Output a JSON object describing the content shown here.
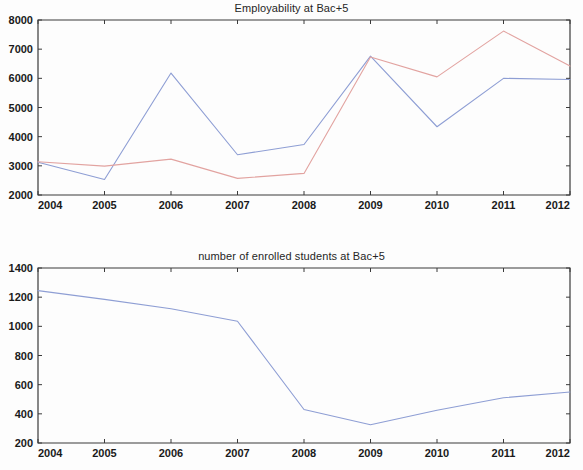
{
  "figure": {
    "background_color": "#fdfdfd",
    "axis_color": "#3a3a3a",
    "width": 583,
    "height": 470
  },
  "chart_data": [
    {
      "type": "line",
      "id": "employability",
      "title": "Employability at Bac+5",
      "xlabel": "",
      "ylabel": "",
      "x": [
        2004,
        2005,
        2006,
        2007,
        2008,
        2009,
        2010,
        2011,
        2012
      ],
      "categories": [
        "2004",
        "2005",
        "2006",
        "2007",
        "2008",
        "2009",
        "2010",
        "2011",
        "2012"
      ],
      "xlim": [
        2004,
        2012
      ],
      "ylim": [
        2000,
        8000
      ],
      "ytick_labels": [
        "8000",
        "7000",
        "6000",
        "5000",
        "4000",
        "3000",
        "2000"
      ],
      "yticks": [
        8000,
        7000,
        6000,
        5000,
        4000,
        3000,
        2000
      ],
      "xtick_labels": [
        "2004",
        "2005",
        "2006",
        "2007",
        "2008",
        "2009",
        "2010",
        "2011",
        "2012"
      ],
      "grid": false,
      "legend_position": "none",
      "series": [
        {
          "name": "series-blue",
          "color": "#8e9ed4",
          "values": [
            3120,
            2530,
            6180,
            3380,
            3730,
            6760,
            4340,
            6000,
            5960
          ]
        },
        {
          "name": "series-red",
          "color": "#e2a3a0",
          "values": [
            3140,
            2990,
            3230,
            2570,
            2740,
            6730,
            6050,
            7620,
            6420
          ]
        }
      ]
    },
    {
      "type": "line",
      "id": "enrolled-students",
      "title": "number of enrolled students at Bac+5",
      "xlabel": "",
      "ylabel": "",
      "x": [
        2004,
        2005,
        2006,
        2007,
        2008,
        2009,
        2010,
        2011,
        2012
      ],
      "categories": [
        "2004",
        "2005",
        "2006",
        "2007",
        "2008",
        "2009",
        "2010",
        "2011",
        "2012"
      ],
      "xlim": [
        2004,
        2012
      ],
      "ylim": [
        200,
        1400
      ],
      "ytick_labels": [
        "1400",
        "1200",
        "1000",
        "800",
        "600",
        "400",
        "200"
      ],
      "yticks": [
        1400,
        1200,
        1000,
        800,
        600,
        400,
        200
      ],
      "xtick_labels": [
        "2004",
        "2005",
        "2006",
        "2007",
        "2008",
        "2009",
        "2010",
        "2011",
        "2012"
      ],
      "grid": false,
      "legend_position": "none",
      "series": [
        {
          "name": "series-blue",
          "color": "#8e9ed4",
          "values": [
            1245,
            1185,
            1120,
            1035,
            430,
            325,
            425,
            510,
            550
          ]
        }
      ]
    }
  ]
}
